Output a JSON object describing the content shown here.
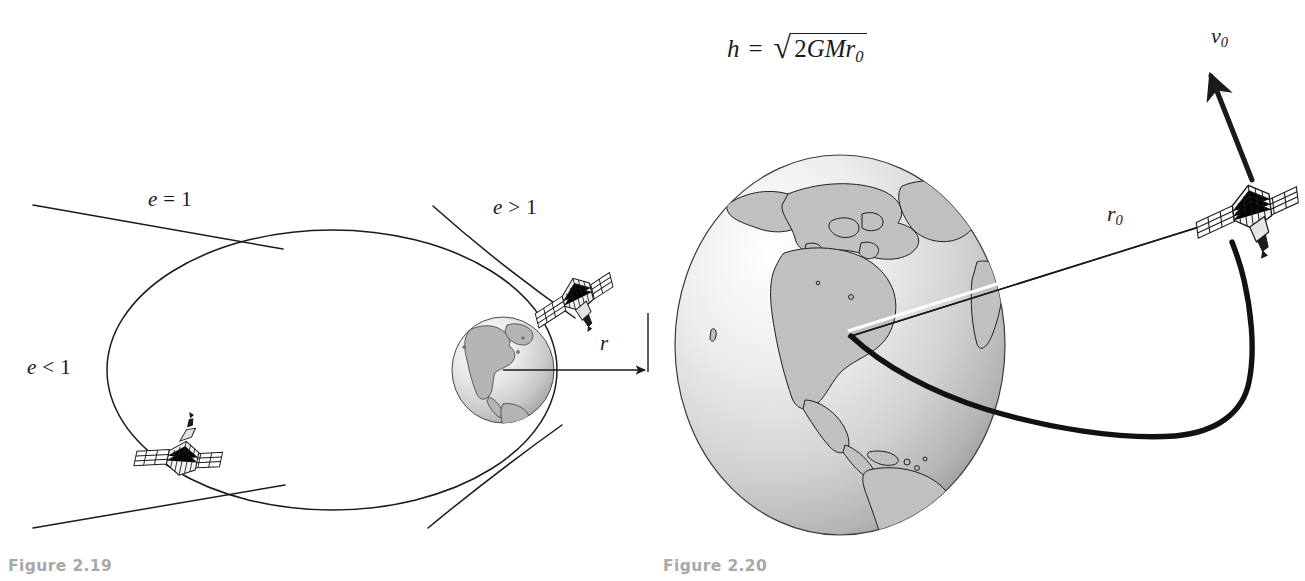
{
  "page": {
    "background": "#ffffff",
    "ink": "#1a1a1a",
    "caption_color": "#a8a8a8",
    "width": 1305,
    "height": 581
  },
  "figure_219": {
    "caption": "Figure 2.19",
    "labels": {
      "ellipse": "e < 1",
      "parabola": "e = 1",
      "hyperbola": "e > 1",
      "radius": "r"
    },
    "label_parts": {
      "ellipse_var": "e",
      "ellipse_rel": "<",
      "ellipse_val": "1",
      "parabola_var": "e",
      "parabola_rel": "=",
      "parabola_val": "1",
      "hyperbola_var": "e",
      "hyperbola_rel": ">",
      "hyperbola_val": "1",
      "radius_var": "r"
    },
    "objects": [
      "earth-globe",
      "satellite-upper-right",
      "satellite-lower-left",
      "elliptical-orbit",
      "parabolic-trajectory",
      "hyperbolic-trajectory",
      "radius-arrow"
    ]
  },
  "figure_220": {
    "caption": "Figure 2.20",
    "equation": {
      "lhs": "h",
      "operator": "=",
      "radical_sign": "√",
      "radicand_coefficient": "2",
      "radicand_G": "G",
      "radicand_M": "M",
      "radicand_r": "r",
      "radicand_r_sub": "0",
      "plain": "h = √(2GMr0)"
    },
    "labels": {
      "radius_var": "r",
      "radius_sub": "0",
      "velocity_var": "v",
      "velocity_sub": "0"
    },
    "objects": [
      "earth-globe",
      "satellite",
      "escape-trajectory",
      "radius-vector-arrow",
      "velocity-vector-arrow"
    ]
  }
}
